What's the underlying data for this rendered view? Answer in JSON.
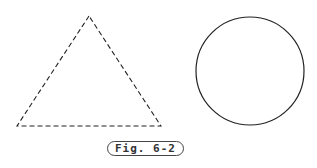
{
  "figure": {
    "caption": "Fig. 6-2",
    "shapes": [
      {
        "type": "triangle",
        "style": "dashed",
        "points": [
          [
            89,
            16
          ],
          [
            17,
            126
          ],
          [
            161,
            126
          ]
        ]
      },
      {
        "type": "circle",
        "style": "solid",
        "center": [
          250,
          71
        ],
        "radius": 54
      }
    ],
    "stroke_color": "#222222"
  }
}
